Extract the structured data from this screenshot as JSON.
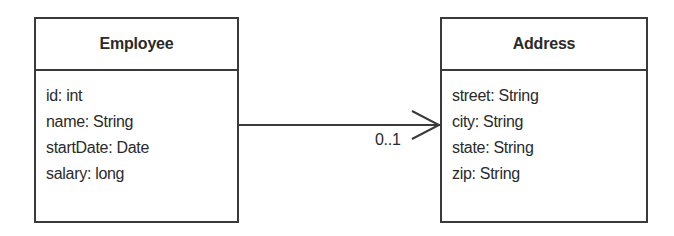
{
  "diagram": {
    "type": "UML class diagram",
    "classes": [
      {
        "name": "Employee",
        "attributes": [
          "id: int",
          "name: String",
          "startDate: Date",
          "salary: long"
        ]
      },
      {
        "name": "Address",
        "attributes": [
          "street: String",
          "city: String",
          "state: String",
          "zip: String"
        ]
      }
    ],
    "association": {
      "from": "Employee",
      "to": "Address",
      "navigability": "unidirectional-open-arrow",
      "target_multiplicity": "0..1"
    },
    "colors": {
      "stroke": "#3a3a3a",
      "text": "#2a2a2a",
      "background": "#ffffff"
    }
  }
}
